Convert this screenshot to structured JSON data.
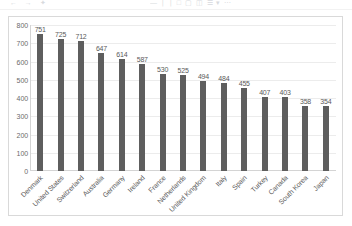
{
  "toolbar": {
    "icons": [
      "undo-icon",
      "redo-icon",
      "format-painter-icon",
      "bold-icon",
      "italic-icon",
      "underline-icon",
      "border-icon",
      "fill-color-icon",
      "font-color-icon",
      "merge-icon",
      "wrap-text-icon",
      "align-icon",
      "insert-icon"
    ]
  },
  "chart_data": {
    "type": "bar",
    "title": "",
    "subtitle": "",
    "xlabel": "",
    "ylabel": "",
    "ylim": [
      0,
      800
    ],
    "ytick_step": 100,
    "yticks": [
      "800",
      "700",
      "600",
      "500",
      "400",
      "300",
      "200",
      "100",
      "0"
    ],
    "grid": true,
    "legend": "none",
    "bar_color": "#5e5e5e",
    "gridline_color": "#ececec",
    "axis_color": "#d4d4d4",
    "label_color": "#5a5a5a",
    "categories": [
      "Denmark",
      "United States",
      "Switzerland",
      "Australia",
      "Germany",
      "Ireland",
      "France",
      "Netherlands",
      "United Kingdom",
      "Italy",
      "Spain",
      "Turkey",
      "Canada",
      "South Korea",
      "Japan"
    ],
    "values": [
      751,
      725,
      712,
      647,
      614,
      587,
      530,
      525,
      494,
      484,
      455,
      407,
      403,
      358,
      354
    ],
    "data_labels": [
      "751",
      "725",
      "712",
      "647",
      "614",
      "587",
      "530",
      "525",
      "494",
      "484",
      "455",
      "407",
      "403",
      "358",
      "354"
    ]
  }
}
